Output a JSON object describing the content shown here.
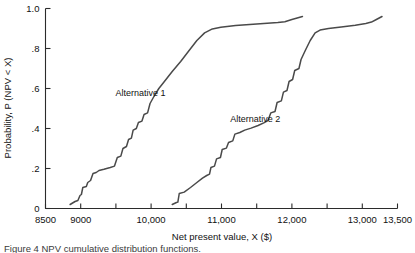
{
  "figure": {
    "caption": "Figure 4  NPV cumulative distribution functions."
  },
  "chart_data": {
    "type": "line",
    "title": "",
    "xlabel": "Net present value, X ($)",
    "ylabel": "Probability, P (NPV < X)",
    "xlim": [
      8500,
      13500
    ],
    "ylim": [
      0,
      1.0
    ],
    "grid": false,
    "legend_position": "inline-annotation",
    "x_major_ticks": [
      8500,
      9000,
      10000,
      11000,
      12000,
      13000,
      13500
    ],
    "x_major_tick_labels": [
      "8500",
      "9000",
      "10,000",
      "11,000",
      "12,000",
      "13,000",
      "13,500"
    ],
    "x_minor_ticks": [
      9500,
      10500,
      11500,
      12500
    ],
    "y_ticks": [
      0,
      0.2,
      0.4,
      0.6,
      0.8,
      1.0
    ],
    "y_tick_labels": [
      "0",
      ".2",
      ".4",
      ".6",
      ".8",
      "1.0"
    ],
    "series": [
      {
        "name": "Alternative 1",
        "label_x": 9850,
        "label_y": 0.565,
        "points": [
          [
            8850,
            0.02
          ],
          [
            8920,
            0.035
          ],
          [
            8960,
            0.04
          ],
          [
            8990,
            0.065
          ],
          [
            9010,
            0.07
          ],
          [
            9030,
            0.105
          ],
          [
            9080,
            0.11
          ],
          [
            9100,
            0.13
          ],
          [
            9140,
            0.14
          ],
          [
            9175,
            0.175
          ],
          [
            9220,
            0.18
          ],
          [
            9260,
            0.19
          ],
          [
            9330,
            0.196
          ],
          [
            9420,
            0.205
          ],
          [
            9480,
            0.212
          ],
          [
            9520,
            0.255
          ],
          [
            9570,
            0.262
          ],
          [
            9600,
            0.3
          ],
          [
            9650,
            0.31
          ],
          [
            9680,
            0.345
          ],
          [
            9720,
            0.352
          ],
          [
            9745,
            0.392
          ],
          [
            9790,
            0.4
          ],
          [
            9820,
            0.43
          ],
          [
            9870,
            0.437
          ],
          [
            9900,
            0.47
          ],
          [
            9950,
            0.478
          ],
          [
            9985,
            0.525
          ],
          [
            10040,
            0.56
          ],
          [
            10110,
            0.6
          ],
          [
            10200,
            0.64
          ],
          [
            10300,
            0.685
          ],
          [
            10420,
            0.735
          ],
          [
            10540,
            0.79
          ],
          [
            10650,
            0.84
          ],
          [
            10760,
            0.878
          ],
          [
            10870,
            0.898
          ],
          [
            10990,
            0.906
          ],
          [
            11200,
            0.915
          ],
          [
            11500,
            0.923
          ],
          [
            11800,
            0.93
          ],
          [
            11900,
            0.934
          ],
          [
            12000,
            0.945
          ],
          [
            12150,
            0.96
          ]
        ]
      },
      {
        "name": "Alternative 2",
        "label_x": 11480,
        "label_y": 0.435,
        "points": [
          [
            10300,
            0.02
          ],
          [
            10360,
            0.03
          ],
          [
            10380,
            0.032
          ],
          [
            10400,
            0.075
          ],
          [
            10470,
            0.082
          ],
          [
            10560,
            0.105
          ],
          [
            10650,
            0.13
          ],
          [
            10730,
            0.152
          ],
          [
            10790,
            0.165
          ],
          [
            10830,
            0.172
          ],
          [
            10850,
            0.205
          ],
          [
            10900,
            0.212
          ],
          [
            10930,
            0.248
          ],
          [
            10985,
            0.255
          ],
          [
            11010,
            0.295
          ],
          [
            11070,
            0.302
          ],
          [
            11100,
            0.33
          ],
          [
            11160,
            0.338
          ],
          [
            11190,
            0.372
          ],
          [
            11260,
            0.38
          ],
          [
            11330,
            0.392
          ],
          [
            11420,
            0.402
          ],
          [
            11520,
            0.415
          ],
          [
            11600,
            0.428
          ],
          [
            11660,
            0.44
          ],
          [
            11700,
            0.478
          ],
          [
            11760,
            0.485
          ],
          [
            11790,
            0.53
          ],
          [
            11850,
            0.538
          ],
          [
            11880,
            0.582
          ],
          [
            11930,
            0.59
          ],
          [
            11960,
            0.635
          ],
          [
            12010,
            0.645
          ],
          [
            12040,
            0.69
          ],
          [
            12100,
            0.7
          ],
          [
            12130,
            0.745
          ],
          [
            12190,
            0.79
          ],
          [
            12260,
            0.84
          ],
          [
            12330,
            0.878
          ],
          [
            12400,
            0.892
          ],
          [
            12520,
            0.9
          ],
          [
            12700,
            0.908
          ],
          [
            12900,
            0.916
          ],
          [
            13050,
            0.925
          ],
          [
            13130,
            0.932
          ],
          [
            13200,
            0.945
          ],
          [
            13280,
            0.96
          ]
        ]
      }
    ]
  }
}
